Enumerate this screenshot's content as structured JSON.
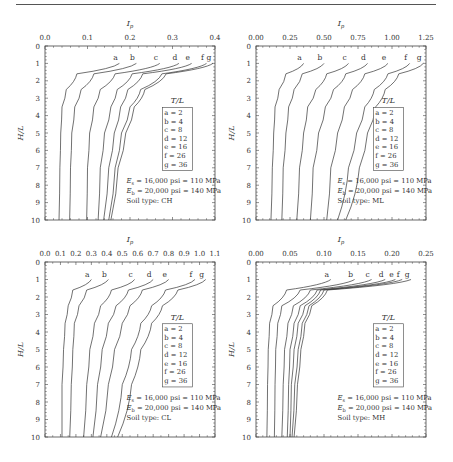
{
  "chart_data": [
    {
      "type": "line",
      "title": "",
      "xlabel": "I_p",
      "ylabel": "H/L",
      "xlim": [
        0,
        0.4
      ],
      "ylim": [
        0,
        10
      ],
      "y_inverted": true,
      "x_ticks": [
        "0.0",
        "0.1",
        "0.2",
        "0.3",
        "0.4"
      ],
      "y_ticks": [
        "0",
        "1",
        "2",
        "3",
        "4",
        "5",
        "6",
        "7",
        "8",
        "9",
        "10"
      ],
      "legend_title": "T/L",
      "legend": [
        "a = 2",
        "b = 4",
        "c = 8",
        "d = 12",
        "e = 16",
        "f = 26",
        "g = 36"
      ],
      "annotations": [
        "E_s = 16,000 psi = 110 MPa",
        "E_b = 20,000 psi = 140 MPa",
        "Soil type: CH"
      ],
      "series": [
        {
          "name": "a",
          "y": [
            1,
            1.6,
            2.5,
            3.5,
            5,
            7,
            10
          ],
          "x": [
            0.175,
            0.075,
            0.05,
            0.04,
            0.037,
            0.035,
            0.033
          ]
        },
        {
          "name": "b",
          "y": [
            1,
            1.6,
            2.5,
            3.5,
            5,
            7,
            10
          ],
          "x": [
            0.215,
            0.115,
            0.085,
            0.07,
            0.063,
            0.06,
            0.058
          ]
        },
        {
          "name": "c",
          "y": [
            1,
            1.6,
            2.5,
            3.5,
            5,
            7,
            10
          ],
          "x": [
            0.27,
            0.165,
            0.13,
            0.115,
            0.105,
            0.1,
            0.098
          ]
        },
        {
          "name": "d",
          "y": [
            1,
            1.6,
            2.5,
            3.5,
            5,
            7,
            10
          ],
          "x": [
            0.315,
            0.205,
            0.17,
            0.155,
            0.14,
            0.13,
            0.125
          ]
        },
        {
          "name": "e",
          "y": [
            1,
            1.6,
            2.5,
            3.5,
            5,
            7,
            10
          ],
          "x": [
            0.345,
            0.23,
            0.195,
            0.178,
            0.163,
            0.15,
            0.138
          ]
        },
        {
          "name": "f",
          "y": [
            1,
            1.6,
            2.5,
            3.5,
            5,
            7,
            10
          ],
          "x": [
            0.38,
            0.275,
            0.225,
            0.2,
            0.18,
            0.165,
            0.15
          ]
        },
        {
          "name": "g",
          "y": [
            1,
            1.6,
            2.5,
            3.5,
            5,
            7,
            10
          ],
          "x": [
            0.395,
            0.285,
            0.235,
            0.21,
            0.19,
            0.172,
            0.155
          ]
        }
      ]
    },
    {
      "type": "line",
      "title": "",
      "xlabel": "I_p",
      "ylabel": "H/L",
      "xlim": [
        0,
        1.25
      ],
      "ylim": [
        0,
        10
      ],
      "y_inverted": true,
      "x_ticks": [
        "0.00",
        "0.25",
        "0.50",
        "0.75",
        "1.00",
        "1.25"
      ],
      "y_ticks": [
        "0",
        "1",
        "2",
        "3",
        "4",
        "5",
        "6",
        "7",
        "8",
        "9",
        "10"
      ],
      "legend_title": "T/L",
      "legend": [
        "a = 2",
        "b = 4",
        "c = 8",
        "d = 12",
        "e = 16",
        "f = 26",
        "g = 36"
      ],
      "annotations": [
        "E_s = 16,000 psi = 110 MPa",
        "E_b = 20,000 psi = 140 MPa",
        "Soil type: ML"
      ],
      "series": [
        {
          "name": "a",
          "y": [
            1,
            1.6,
            2.5,
            3.5,
            5,
            7,
            10
          ],
          "x": [
            0.35,
            0.22,
            0.17,
            0.14,
            0.13,
            0.12,
            0.11
          ]
        },
        {
          "name": "b",
          "y": [
            1,
            1.6,
            2.5,
            3.5,
            5,
            7,
            10
          ],
          "x": [
            0.5,
            0.34,
            0.28,
            0.24,
            0.22,
            0.2,
            0.19
          ]
        },
        {
          "name": "c",
          "y": [
            1,
            1.6,
            2.5,
            3.5,
            5,
            7,
            10
          ],
          "x": [
            0.68,
            0.52,
            0.44,
            0.38,
            0.35,
            0.32,
            0.3
          ]
        },
        {
          "name": "d",
          "y": [
            1,
            1.6,
            2.5,
            3.5,
            5,
            7,
            10
          ],
          "x": [
            0.82,
            0.66,
            0.57,
            0.51,
            0.46,
            0.42,
            0.4
          ]
        },
        {
          "name": "e",
          "y": [
            1,
            1.6,
            2.5,
            3.5,
            5,
            7,
            10
          ],
          "x": [
            0.97,
            0.8,
            0.71,
            0.65,
            0.6,
            0.55,
            0.52
          ]
        },
        {
          "name": "f",
          "y": [
            1,
            1.6,
            2.5,
            3.5,
            5,
            7,
            10
          ],
          "x": [
            1.13,
            0.97,
            0.87,
            0.8,
            0.74,
            0.68,
            0.6
          ]
        },
        {
          "name": "g",
          "y": [
            1,
            1.6,
            2.5,
            3.5,
            5,
            7,
            10
          ],
          "x": [
            1.23,
            1.05,
            0.95,
            0.88,
            0.82,
            0.76,
            0.66
          ]
        }
      ]
    },
    {
      "type": "line",
      "title": "",
      "xlabel": "I_p",
      "ylabel": "H/L",
      "xlim": [
        0,
        1.1
      ],
      "ylim": [
        0,
        10
      ],
      "y_inverted": true,
      "x_ticks": [
        "0.0",
        "0.1",
        "0.2",
        "0.3",
        "0.4",
        "0.5",
        "0.6",
        "0.7",
        "0.8",
        "0.9",
        "1.0",
        "1.1"
      ],
      "y_ticks": [
        "0",
        "1",
        "2",
        "3",
        "4",
        "5",
        "6",
        "7",
        "8",
        "9",
        "10"
      ],
      "legend_title": "T/L",
      "legend": [
        "a = 2",
        "b = 4",
        "c = 8",
        "d = 12",
        "e = 16",
        "f = 26",
        "g = 36"
      ],
      "annotations": [
        "E_s = 16,000 psi = 110 MPa",
        "E_b = 20,000 psi = 140 MPa",
        "Soil type: CL"
      ],
      "series": [
        {
          "name": "a",
          "y": [
            1,
            1.6,
            2.5,
            3.5,
            5,
            7,
            10
          ],
          "x": [
            0.3,
            0.18,
            0.15,
            0.13,
            0.12,
            0.11,
            0.11
          ]
        },
        {
          "name": "b",
          "y": [
            1,
            1.6,
            2.5,
            3.5,
            5,
            7,
            10
          ],
          "x": [
            0.41,
            0.27,
            0.22,
            0.19,
            0.18,
            0.17,
            0.16
          ]
        },
        {
          "name": "c",
          "y": [
            1,
            1.6,
            2.5,
            3.5,
            5,
            7,
            10
          ],
          "x": [
            0.58,
            0.43,
            0.36,
            0.32,
            0.29,
            0.27,
            0.25
          ]
        },
        {
          "name": "d",
          "y": [
            1,
            1.6,
            2.5,
            3.5,
            5,
            7,
            10
          ],
          "x": [
            0.7,
            0.54,
            0.46,
            0.41,
            0.37,
            0.34,
            0.31
          ]
        },
        {
          "name": "e",
          "y": [
            1,
            1.6,
            2.5,
            3.5,
            5,
            7,
            10
          ],
          "x": [
            0.8,
            0.63,
            0.55,
            0.5,
            0.45,
            0.41,
            0.36
          ]
        },
        {
          "name": "f",
          "y": [
            1,
            1.6,
            2.5,
            3.5,
            5,
            7,
            10
          ],
          "x": [
            0.97,
            0.78,
            0.69,
            0.62,
            0.56,
            0.5,
            0.43
          ]
        },
        {
          "name": "g",
          "y": [
            1,
            1.6,
            2.5,
            3.5,
            5,
            7,
            10
          ],
          "x": [
            1.04,
            0.86,
            0.76,
            0.69,
            0.62,
            0.56,
            0.47
          ]
        }
      ]
    },
    {
      "type": "line",
      "title": "",
      "xlabel": "I_p",
      "ylabel": "H/L",
      "xlim": [
        0,
        0.25
      ],
      "ylim": [
        0,
        10
      ],
      "y_inverted": true,
      "x_ticks": [
        "0.00",
        "0.05",
        "0.10",
        "0.15",
        "0.20",
        "0.25"
      ],
      "y_ticks": [
        "0",
        "1",
        "2",
        "3",
        "4",
        "5",
        "6",
        "7",
        "8",
        "9",
        "10"
      ],
      "legend_title": "T/L",
      "legend": [
        "a = 2",
        "b = 4",
        "c = 8",
        "d = 12",
        "e = 16",
        "f = 26",
        "g = 36"
      ],
      "annotations": [
        "E_s = 16,000 psi = 110 MPa",
        "E_b = 20,000 psi = 140 MPa",
        "Soil type: MH"
      ],
      "series": [
        {
          "name": "a",
          "y": [
            1,
            1.6,
            2.5,
            3.5,
            5,
            7,
            10
          ],
          "x": [
            0.11,
            0.045,
            0.025,
            0.02,
            0.018,
            0.017,
            0.016
          ]
        },
        {
          "name": "b",
          "y": [
            1,
            1.6,
            2.5,
            3.5,
            5,
            7,
            10
          ],
          "x": [
            0.145,
            0.065,
            0.038,
            0.032,
            0.029,
            0.028,
            0.027
          ]
        },
        {
          "name": "c",
          "y": [
            1,
            1.6,
            2.5,
            3.5,
            5,
            7,
            10
          ],
          "x": [
            0.17,
            0.08,
            0.055,
            0.047,
            0.042,
            0.04,
            0.038
          ]
        },
        {
          "name": "d",
          "y": [
            1,
            1.6,
            2.5,
            3.5,
            5,
            7,
            10
          ],
          "x": [
            0.19,
            0.09,
            0.065,
            0.056,
            0.05,
            0.048,
            0.046
          ]
        },
        {
          "name": "e",
          "y": [
            1,
            1.6,
            2.5,
            3.5,
            5,
            7,
            10
          ],
          "x": [
            0.205,
            0.095,
            0.072,
            0.062,
            0.056,
            0.052,
            0.05
          ]
        },
        {
          "name": "f",
          "y": [
            1,
            1.6,
            2.5,
            3.5,
            5,
            7,
            10
          ],
          "x": [
            0.215,
            0.1,
            0.078,
            0.068,
            0.062,
            0.057,
            0.053
          ]
        },
        {
          "name": "g",
          "y": [
            1,
            1.6,
            2.5,
            3.5,
            5,
            7,
            10
          ],
          "x": [
            0.228,
            0.105,
            0.082,
            0.072,
            0.066,
            0.061,
            0.056
          ]
        }
      ]
    }
  ]
}
